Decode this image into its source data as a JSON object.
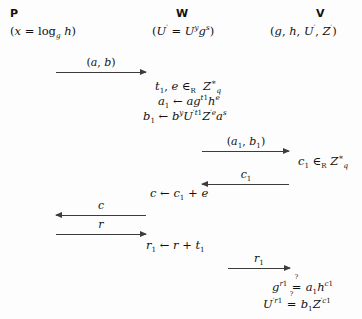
{
  "diagram": {
    "kind": "cryptographic-protocol-sequence",
    "background_color": "#fdfdfd",
    "ink_color": "#111111",
    "arrow_color": "#3c3c3c",
    "parties": [
      {
        "id": "P",
        "label": "P",
        "params": "(x = logg h)",
        "params_plain": "(x = log_g h)"
      },
      {
        "id": "W",
        "label": "W",
        "params_plain": "(U' = U^y g^s)"
      },
      {
        "id": "V",
        "label": "V",
        "params_plain": "(g, h, U', Z')"
      }
    ],
    "messages": [
      {
        "id": "m1",
        "label": "(a, b)",
        "direction": "right",
        "from": "P",
        "to": "W"
      },
      {
        "id": "m2",
        "label": "(a₁, b₁)",
        "direction": "right",
        "from": "W",
        "to": "V"
      },
      {
        "id": "m3",
        "label": "c₁",
        "direction": "left",
        "from": "V",
        "to": "W"
      },
      {
        "id": "m4",
        "label": "c",
        "direction": "left",
        "from": "W",
        "to": "P"
      },
      {
        "id": "m5",
        "label": "r",
        "direction": "right",
        "from": "P",
        "to": "W"
      },
      {
        "id": "m6",
        "label": "r₁",
        "direction": "right",
        "from": "W",
        "to": "V"
      }
    ],
    "computations": [
      {
        "id": "c1",
        "party": "W",
        "text_plain": "t₁, e ∈_R Z*_q"
      },
      {
        "id": "c2",
        "party": "W",
        "text_plain": "a₁ ← a g^{t₁} h^e"
      },
      {
        "id": "c3",
        "party": "W",
        "text_plain": "b₁ ← b^y U'^{t₁} Z'^e a^s"
      },
      {
        "id": "c4",
        "party": "V",
        "text_plain": "c₁ ∈_R Z*_q"
      },
      {
        "id": "c5",
        "party": "W",
        "text_plain": "c ← c₁ + e"
      },
      {
        "id": "c6",
        "party": "W",
        "text_plain": "r₁ ← r + t₁"
      },
      {
        "id": "c7",
        "party": "V",
        "text_plain": "g^{r₁} ?= a₁ h^{c₁}"
      },
      {
        "id": "c8",
        "party": "V",
        "text_plain": "U'^{r₁} ?= b₁ Z'^{c₁}"
      }
    ],
    "symbols": {
      "elem_of": "∈",
      "assign": "←",
      "equals": "=",
      "plus": "+",
      "question": "?",
      "star": "*",
      "subscript_R": "R",
      "subscript_q": "q",
      "one": "1",
      "prime": "'",
      "var_x": "x",
      "var_g": "g",
      "var_h": "h",
      "var_a": "a",
      "var_b": "b",
      "var_c": "c",
      "var_e": "e",
      "var_r": "r",
      "var_s": "s",
      "var_t": "t",
      "var_y": "y",
      "var_U": "U",
      "var_Z": "Z",
      "log": "log"
    }
  }
}
